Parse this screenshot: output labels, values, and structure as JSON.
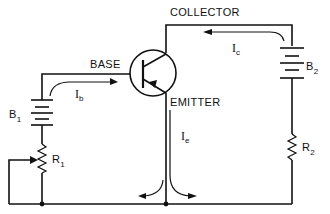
{
  "diagram": {
    "type": "circuit-schematic",
    "labels": {
      "base": "BASE",
      "collector": "COLLECTOR",
      "emitter": "EMITTER"
    },
    "components": {
      "b1": {
        "letter": "B",
        "sub": "1",
        "kind": "battery"
      },
      "b2": {
        "letter": "B",
        "sub": "2",
        "kind": "battery"
      },
      "r1": {
        "letter": "R",
        "sub": "1",
        "kind": "variable-resistor"
      },
      "r2": {
        "letter": "R",
        "sub": "2",
        "kind": "resistor"
      }
    },
    "currents": {
      "ib": {
        "letter": "I",
        "sub": "b"
      },
      "ic": {
        "letter": "I",
        "sub": "c"
      },
      "ie": {
        "letter": "I",
        "sub": "e"
      }
    },
    "colors": {
      "ink": "#111111",
      "background": "#ffffff"
    }
  }
}
